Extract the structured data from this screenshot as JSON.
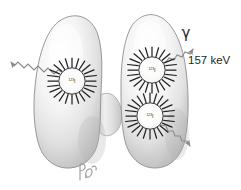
{
  "figure": {
    "style": "grayscale-medical-illustration",
    "background_color": "#ffffff",
    "outline_color": "#8d8d8d",
    "fill_light": "#fdfdfd",
    "fill_mid": "#e3e3e3",
    "fill_shadow": "#b8b8b8",
    "ray_color": "#242424"
  },
  "annotations": {
    "gamma_symbol": "γ",
    "energy_label": "157 keV",
    "signature": "RB"
  },
  "sources": [
    {
      "id": "left-lobe-source",
      "isotope_mass": "123",
      "isotope_element": "I",
      "label": "123I",
      "cx": 72,
      "cy": 81,
      "radius": 13,
      "ray_count": 22,
      "ray_length": 10
    },
    {
      "id": "right-lobe-upper-source",
      "isotope_mass": "123",
      "isotope_element": "I",
      "label": "123I",
      "cx": 152,
      "cy": 70,
      "radius": 13,
      "ray_count": 22,
      "ray_length": 10
    },
    {
      "id": "right-lobe-lower-source",
      "isotope_mass": "123",
      "isotope_element": "I",
      "label": "123I",
      "cx": 150,
      "cy": 116,
      "radius": 13,
      "ray_count": 22,
      "ray_length": 10
    }
  ],
  "gamma_rays": [
    {
      "id": "gamma-ray-upper-left",
      "direction": "up-left",
      "from": {
        "x": 64,
        "y": 72
      },
      "to": {
        "x": 12,
        "y": 48
      }
    },
    {
      "id": "gamma-ray-upper-right",
      "direction": "up-right",
      "from": {
        "x": 158,
        "y": 62
      },
      "to": {
        "x": 196,
        "y": 40
      }
    },
    {
      "id": "gamma-ray-lower-right",
      "direction": "down-right",
      "from": {
        "x": 160,
        "y": 124
      },
      "to": {
        "x": 196,
        "y": 150
      }
    }
  ],
  "anatomy": {
    "left_lobe": "thyroid-left-lobe",
    "right_lobe": "thyroid-right-lobe",
    "isthmus": "thyroid-isthmus"
  }
}
